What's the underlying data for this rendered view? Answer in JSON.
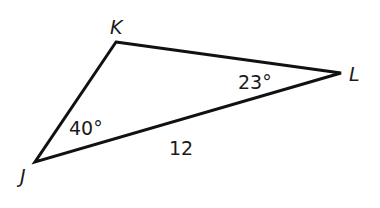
{
  "diagram": {
    "type": "triangle",
    "stroke_color": "#111111",
    "vertices": {
      "K": {
        "label": "K"
      },
      "L": {
        "label": "L"
      },
      "J": {
        "label": "J"
      }
    },
    "angles": {
      "L": "23°",
      "J": "40°"
    },
    "sides": {
      "JL": "12"
    }
  }
}
